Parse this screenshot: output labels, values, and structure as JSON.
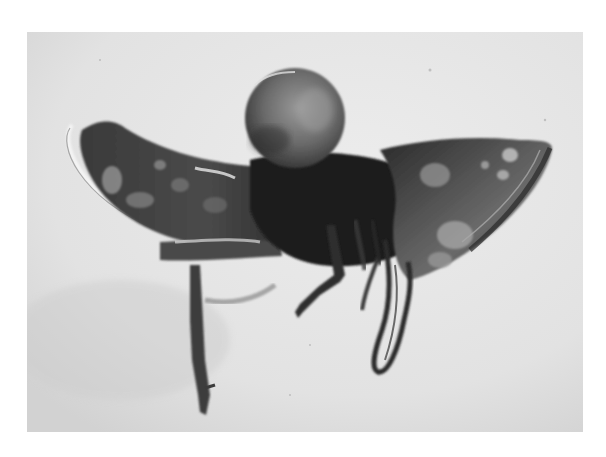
{
  "image": {
    "description": "Grayscale photograph of an insect specimen (leafhopper-like) preserved in amber, shown in lateral view",
    "colors": {
      "border": "#ffffff",
      "background": "#e4e4e4",
      "background_shadow": "#cfcfcf",
      "body_dark": "#2a2a2a",
      "body_mid": "#5a5a5a",
      "head_mid": "#6e6e6e",
      "highlight": "#bdbdbd"
    },
    "frame": {
      "x": 27,
      "y": 32,
      "width": 556,
      "height": 400
    },
    "subjects": [
      {
        "name": "head",
        "shape": "round dome",
        "cx": 295,
        "cy": 120,
        "r": 50
      },
      {
        "name": "left-wing",
        "shape": "curved crescent wing with pale outline",
        "from_x": 65,
        "to_x": 300
      },
      {
        "name": "right-wing",
        "shape": "fan-shaped wing with pale spots",
        "from_x": 400,
        "to_x": 553
      },
      {
        "name": "foreleg",
        "shape": "long vertical leg hanging down",
        "x": 195,
        "y_end": 415
      },
      {
        "name": "midleg",
        "shape": "bent leg",
        "x": 300,
        "y_end": 320
      },
      {
        "name": "hindleg",
        "shape": "looped leg",
        "x": 375,
        "y_end": 370
      }
    ]
  }
}
